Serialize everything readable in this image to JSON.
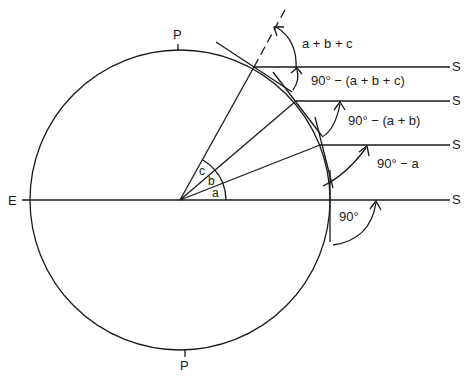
{
  "diagram": {
    "labels": {
      "east": "E",
      "pole_top": "P",
      "pole_bottom": "P",
      "sun_1": "S",
      "sun_2": "S",
      "sun_3": "S",
      "sun_4": "S",
      "angle_a": "a",
      "angle_b": "b",
      "angle_c": "c"
    },
    "annotations": {
      "sum_abc": "a + b + c",
      "ninety_minus_abc": "90° − (a + b + c)",
      "ninety_minus_ab": "90° − (a + b)",
      "ninety_minus_a": "90° − a",
      "ninety": "90°"
    },
    "stroke_color": "#1a1a1a",
    "background_color": "#ffffff"
  }
}
